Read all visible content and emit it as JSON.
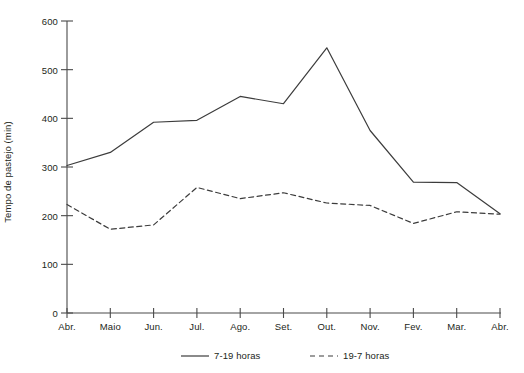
{
  "chart_data": {
    "type": "line",
    "title": "",
    "subtitle": "",
    "xlabel": "",
    "ylabel": "Tempo de pastejo (min)",
    "categories": [
      "Abr.",
      "Maio",
      "Jun.",
      "Jul.",
      "Ago.",
      "Set.",
      "Out.",
      "Nov.",
      "Fev.",
      "Mar.",
      "Abr."
    ],
    "series": [
      {
        "name": "7-19 horas",
        "style": "solid",
        "color": "#3c3c3c",
        "values": [
          303,
          330,
          392,
          396,
          445,
          430,
          545,
          375,
          269,
          268,
          204
        ]
      },
      {
        "name": "19-7 horas",
        "style": "dashed",
        "color": "#3c3c3c",
        "values": [
          223,
          172,
          181,
          258,
          235,
          247,
          226,
          221,
          184,
          208,
          203
        ]
      }
    ],
    "ylim": [
      0,
      600
    ],
    "yticks": [
      0,
      100,
      200,
      300,
      400,
      500,
      600
    ],
    "ytick_labels": [
      "0",
      "100",
      "200",
      "300",
      "400",
      "500",
      "600"
    ],
    "grid": false,
    "legend_position": "bottom",
    "legend": [
      {
        "label": "7-19 horas",
        "style": "solid"
      },
      {
        "label": "19-7 horas",
        "style": "dashed"
      }
    ]
  },
  "axis_color": "#4a4a4a",
  "background": "#ffffff"
}
